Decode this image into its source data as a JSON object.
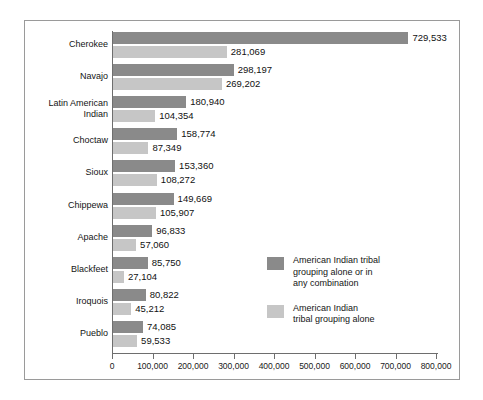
{
  "chart_data": {
    "type": "bar",
    "orientation": "horizontal",
    "grid": false,
    "title": "",
    "xlabel": "",
    "ylabel": "",
    "xlim": [
      0,
      800000
    ],
    "xticks": [
      0,
      100000,
      200000,
      300000,
      400000,
      500000,
      600000,
      700000,
      800000
    ],
    "xtick_labels": [
      "0",
      "100,000",
      "200,000",
      "300,000",
      "400,000",
      "500,000",
      "600,000",
      "700,000",
      "800,000"
    ],
    "categories": [
      "Cherokee",
      "Navajo",
      "Latin American\nIndian",
      "Choctaw",
      "Sioux",
      "Chippewa",
      "Apache",
      "Blackfeet",
      "Iroquois",
      "Pueblo"
    ],
    "series": [
      {
        "name": "American Indian tribal grouping alone or in any combination",
        "key": "combo",
        "color": "#8a8a8a",
        "values": [
          729533,
          298197,
          180940,
          158774,
          153360,
          149669,
          96833,
          85750,
          80822,
          74085
        ],
        "value_labels": [
          "729,533",
          "298,197",
          "180,940",
          "158,774",
          "153,360",
          "149,669",
          "96,833",
          "85,750",
          "80,822",
          "74,085"
        ]
      },
      {
        "name": "American Indian tribal grouping alone",
        "key": "alone",
        "color": "#c6c6c6",
        "values": [
          281069,
          269202,
          104354,
          87349,
          108272,
          105907,
          57060,
          27104,
          45212,
          59533
        ],
        "value_labels": [
          "281,069",
          "269,202",
          "104,354",
          "87,349",
          "108,272",
          "105,907",
          "57,060",
          "27,104",
          "45,212",
          "59,533"
        ]
      }
    ],
    "legend": {
      "position": "inside-right",
      "entries": [
        {
          "label": "American Indian tribal\ngrouping alone or in\nany combination",
          "color": "#8a8a8a"
        },
        {
          "label": "American Indian\ntribal grouping alone",
          "color": "#c6c6c6"
        }
      ]
    }
  }
}
